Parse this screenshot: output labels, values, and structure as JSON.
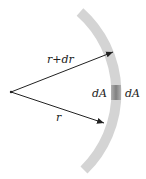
{
  "diagram": {
    "labels": {
      "outer_radius": "r+dr",
      "inner_radius": "r",
      "area_left": "dA",
      "area_right": "dA"
    },
    "colors": {
      "band": "#d4d4d4",
      "patch": "#8c8c8c",
      "arrow": "#222222"
    }
  }
}
